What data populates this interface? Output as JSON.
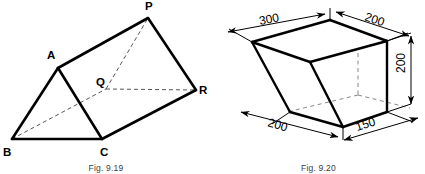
{
  "page": {
    "background_color": "#ffffff",
    "ink_color": "#000000",
    "hidden_line_color": "#555555",
    "width": 425,
    "height": 174
  },
  "figures": [
    {
      "id": "fig-9-19",
      "caption": "Fig. 9.19",
      "type": "triangular-prism-pictorial",
      "description": "Oblique pictorial view of a triangular prism with two triangular end faces ABC and PQR",
      "vertex_labels": [
        {
          "name": "P",
          "text": "P",
          "x": 148,
          "y": 8
        },
        {
          "name": "A",
          "text": "A",
          "x": 52,
          "y": 56
        },
        {
          "name": "Q",
          "text": "Q",
          "x": 104,
          "y": 86
        },
        {
          "name": "R",
          "text": "R",
          "x": 199,
          "y": 92
        },
        {
          "name": "B",
          "text": "B",
          "x": 7,
          "y": 146
        },
        {
          "name": "C",
          "text": "C",
          "x": 105,
          "y": 146
        }
      ],
      "visible_edges": [
        "A-B",
        "B-C",
        "C-A",
        "A-P",
        "C-R",
        "P-R",
        "P-A",
        "B-A"
      ],
      "hidden_edges": [
        "B-Q",
        "Q-R",
        "Q-P"
      ]
    },
    {
      "id": "fig-9-20",
      "caption": "Fig. 9.20",
      "type": "isometric-truncated-solid",
      "description": "Isometric view of a truncated rectangular solid with dimension lines and arrowheads",
      "dimensions": [
        {
          "name": "top-left-width",
          "value": "300",
          "x": 48,
          "y": 23,
          "rotation": -13
        },
        {
          "name": "top-right-width",
          "value": "200",
          "x": 172,
          "y": 22,
          "rotation": 22
        },
        {
          "name": "right-height",
          "value": "200",
          "x": 196,
          "y": 70,
          "rotation": -90
        },
        {
          "name": "bottom-left-depth",
          "value": "200",
          "x": 65,
          "y": 128,
          "rotation": 22
        },
        {
          "name": "bottom-right-width",
          "value": "150",
          "x": 150,
          "y": 128,
          "rotation": -20
        }
      ],
      "visible_edges": [
        "top-rim-front-left",
        "top-rim-front-right",
        "top-rim-back-left",
        "top-rim-back-right",
        "left-slant",
        "right-vertical",
        "bottom-front-left",
        "bottom-front-right",
        "inner-slant"
      ],
      "hidden_edges": [
        "center-vertical",
        "base-back-left",
        "base-back-right"
      ]
    }
  ]
}
